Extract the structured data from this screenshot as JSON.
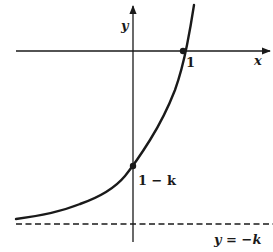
{
  "diagram": {
    "type": "function-graph",
    "colors": {
      "background": "#ffffff",
      "ink": "#1a1a1a"
    },
    "axes": {
      "x_label": "x",
      "y_label": "y"
    },
    "points": [
      {
        "id": "x-intercept",
        "label": "1",
        "coords": [
          1,
          0
        ]
      },
      {
        "id": "y-intercept",
        "label": "1 − k",
        "coords": [
          0,
          "1-k"
        ]
      }
    ],
    "asymptote": {
      "label": "y = −k",
      "style": "dashed"
    }
  }
}
